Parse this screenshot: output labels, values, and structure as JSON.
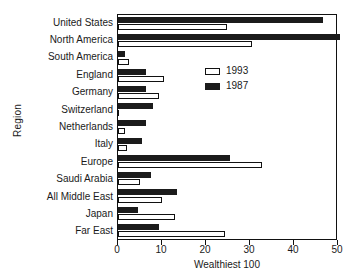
{
  "chart_data": {
    "type": "bar",
    "orientation": "horizontal",
    "title": "",
    "xlabel": "Wealthiest 100",
    "ylabel": "Region",
    "xlim": [
      0,
      50
    ],
    "xticks": [
      0,
      10,
      20,
      30,
      40,
      50
    ],
    "xtick_labels": [
      "0",
      "10",
      "20",
      "30",
      "40",
      "50"
    ],
    "grid": false,
    "legend_position": "upper right inside",
    "categories": [
      "United States",
      "North America",
      "South America",
      "England",
      "Germany",
      "Switzerland",
      "Netherlands",
      "Italy",
      "Europe",
      "Saudi Arabia",
      "All Middle East",
      "Japan",
      "Far East"
    ],
    "series": [
      {
        "name": "1993",
        "style": "open",
        "color": "#ffffff",
        "edge_color": "#111111",
        "values": [
          25.1,
          30.7,
          2.5,
          10.5,
          9.3,
          0,
          1.5,
          2.0,
          33.1,
          5.0,
          10.0,
          13.0,
          24.5
        ]
      },
      {
        "name": "1987",
        "style": "filled",
        "color": "#1b1b1b",
        "edge_color": "#1b1b1b",
        "values": [
          47.0,
          51.0,
          1.5,
          6.5,
          6.5,
          8.0,
          6.5,
          5.5,
          25.6,
          7.5,
          13.5,
          4.5,
          9.5
        ]
      }
    ]
  },
  "legend": {
    "entries": [
      {
        "label": "1993"
      },
      {
        "label": "1987"
      }
    ]
  }
}
